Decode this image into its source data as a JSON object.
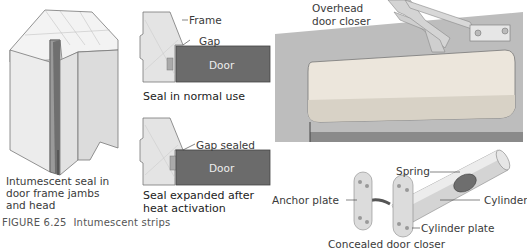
{
  "figure": {
    "number_label": "FIGURE 6.25",
    "caption": "Intumescent strips"
  },
  "left_panel": {
    "callout": [
      "Intumescent seal in",
      "door frame jambs",
      "and head"
    ]
  },
  "middle_panel": {
    "top": {
      "frame_label": "Frame",
      "gap_label": "Gap",
      "door_label": "Door",
      "caption": "Seal in normal use"
    },
    "bottom": {
      "gap_label": "Gap sealed",
      "door_label": "Door",
      "caption": [
        "Seal expanded after",
        "heat activation"
      ]
    }
  },
  "right_panel": {
    "overhead_label": [
      "Overhead",
      "door closer"
    ],
    "concealed": {
      "spring_label": "Spring",
      "cylinder_label": "Cylinder",
      "anchor_plate_label": "Anchor plate",
      "cylinder_plate_label": "Cylinder plate",
      "caption": "Concealed door closer"
    }
  },
  "colors": {
    "door": "#6b6b6b",
    "frame": "#e4e4e4",
    "wall": "#bdbdbd",
    "closer_body": "#e8e2d8",
    "metal": "#c8c8c8"
  }
}
